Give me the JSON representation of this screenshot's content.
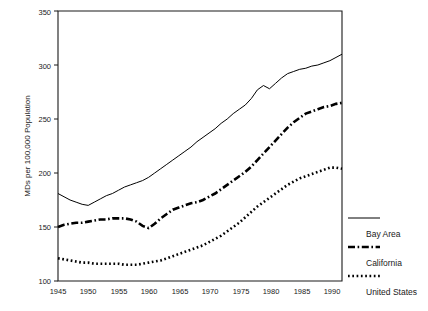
{
  "chart_data": {
    "type": "line",
    "title": "",
    "xlabel": "",
    "ylabel": "MDs per 100,000 Population",
    "xlim": [
      1945,
      1992
    ],
    "ylim": [
      100,
      350
    ],
    "xticks": [
      1945,
      1950,
      1955,
      1960,
      1965,
      1970,
      1975,
      1980,
      1985,
      1990
    ],
    "yticks": [
      100,
      150,
      200,
      250,
      300,
      350
    ],
    "grid": false,
    "legend_position": "right",
    "x": [
      1945,
      1946,
      1947,
      1948,
      1949,
      1950,
      1951,
      1952,
      1953,
      1954,
      1955,
      1956,
      1957,
      1958,
      1959,
      1960,
      1961,
      1962,
      1963,
      1964,
      1965,
      1966,
      1967,
      1968,
      1969,
      1970,
      1971,
      1972,
      1973,
      1974,
      1975,
      1976,
      1977,
      1978,
      1979,
      1980,
      1981,
      1982,
      1983,
      1984,
      1985,
      1986,
      1987,
      1988,
      1989,
      1990,
      1991,
      1992
    ],
    "series": [
      {
        "name": "Bay Area",
        "style": "solid",
        "values": [
          181,
          178,
          175,
          173,
          171,
          170,
          173,
          176,
          179,
          181,
          184,
          187,
          189,
          191,
          193,
          196,
          200,
          204,
          208,
          212,
          216,
          220,
          224,
          229,
          233,
          237,
          241,
          246,
          250,
          255,
          259,
          263,
          269,
          277,
          281,
          278,
          283,
          288,
          292,
          294,
          296,
          297,
          299,
          300,
          302,
          304,
          307,
          310
        ]
      },
      {
        "name": "California",
        "style": "dash-dot",
        "values": [
          150,
          152,
          153,
          154,
          154,
          155,
          156,
          157,
          157,
          158,
          158,
          158,
          157,
          155,
          151,
          149,
          153,
          158,
          162,
          166,
          168,
          170,
          172,
          173,
          175,
          178,
          181,
          185,
          189,
          193,
          197,
          201,
          206,
          212,
          218,
          224,
          230,
          236,
          242,
          247,
          251,
          255,
          257,
          259,
          261,
          262,
          264,
          265
        ]
      },
      {
        "name": "United States",
        "style": "dotted",
        "values": [
          121,
          120,
          119,
          118,
          117,
          117,
          116,
          116,
          116,
          116,
          116,
          115,
          115,
          115,
          116,
          117,
          118,
          119,
          121,
          123,
          125,
          127,
          129,
          131,
          133,
          136,
          139,
          142,
          146,
          150,
          154,
          159,
          164,
          169,
          173,
          177,
          181,
          185,
          189,
          192,
          195,
          197,
          199,
          201,
          203,
          205,
          205,
          204
        ]
      }
    ]
  },
  "legend": {
    "items": [
      {
        "label": "Bay Area",
        "style": "solid"
      },
      {
        "label": "California",
        "style": "dash-dot"
      },
      {
        "label": "United States",
        "style": "dotted"
      }
    ]
  },
  "axes": {
    "y_title": "MDs per 100,000 Population",
    "y_tick_labels": [
      "100",
      "150",
      "200",
      "250",
      "300",
      "350"
    ],
    "x_tick_labels": [
      "1945",
      "1950",
      "1955",
      "1960",
      "1965",
      "1970",
      "1975",
      "1980",
      "1985",
      "1990"
    ]
  }
}
